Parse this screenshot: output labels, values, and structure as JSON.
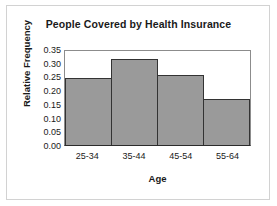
{
  "chart_data": {
    "type": "bar",
    "title": "People Covered by Health Insurance",
    "xlabel": "Age",
    "ylabel": "Relative Frequency",
    "categories": [
      "25-34",
      "35-44",
      "45-54",
      "55-64"
    ],
    "values": [
      0.25,
      0.32,
      0.26,
      0.17
    ],
    "ylim": [
      0.0,
      0.35
    ],
    "yticks": [
      "0.00",
      "0.05",
      "0.10",
      "0.15",
      "0.20",
      "0.25",
      "0.30",
      "0.35"
    ],
    "ytick_values": [
      0.0,
      0.05,
      0.1,
      0.15,
      0.2,
      0.25,
      0.3,
      0.35
    ],
    "grid": false,
    "legend": "none",
    "bar_style": "histogram-adjacent",
    "colors": {
      "bar_fill": "#9a9a9a",
      "bar_outline": "#333333",
      "axis": "#2b2b2b",
      "plot_frame": "#8c8c8c",
      "outer_border": "#d2d2d2",
      "text": "#1a1a1a",
      "background": "#ffffff"
    }
  }
}
